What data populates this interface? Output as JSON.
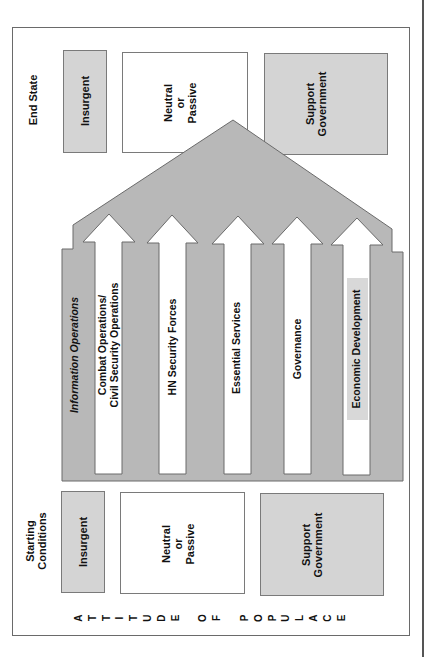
{
  "end_state": {
    "title": "End State",
    "boxes": [
      {
        "label": "Insurgent"
      },
      {
        "label": "Neutral\nor\nPassive",
        "lines": [
          "Neutral",
          "or",
          "Passive"
        ]
      },
      {
        "label": "Support Government",
        "lines": [
          "Support",
          "Government"
        ]
      }
    ]
  },
  "starting_conditions": {
    "title_lines": [
      "Starting",
      "Conditions"
    ],
    "boxes": [
      {
        "label": "Insurgent"
      },
      {
        "lines": [
          "Neutral",
          "or",
          "Passive"
        ]
      },
      {
        "lines": [
          "Support",
          "Government"
        ]
      }
    ]
  },
  "umbrella": {
    "label": "Information Operations"
  },
  "lines_of_operation": [
    {
      "lines": [
        "Combat Operations/",
        "Civil Security Operations"
      ]
    },
    {
      "label": "HN Security Forces"
    },
    {
      "label": "Essential Services"
    },
    {
      "label": "Governance"
    },
    {
      "label": "Economic Development"
    }
  ],
  "axis_label": {
    "letters": [
      "A",
      "T",
      "T",
      "I",
      "T",
      "U",
      "D",
      "E",
      "",
      "O",
      "F",
      "",
      "P",
      "O",
      "P",
      "U",
      "L",
      "A",
      "C",
      "E"
    ],
    "text": "ATTITUDE OF POPULACE"
  },
  "colors": {
    "shape_fill": "#b8b8b8",
    "box_gray": "#d4d4d4",
    "stroke": "#6a6a6a"
  }
}
